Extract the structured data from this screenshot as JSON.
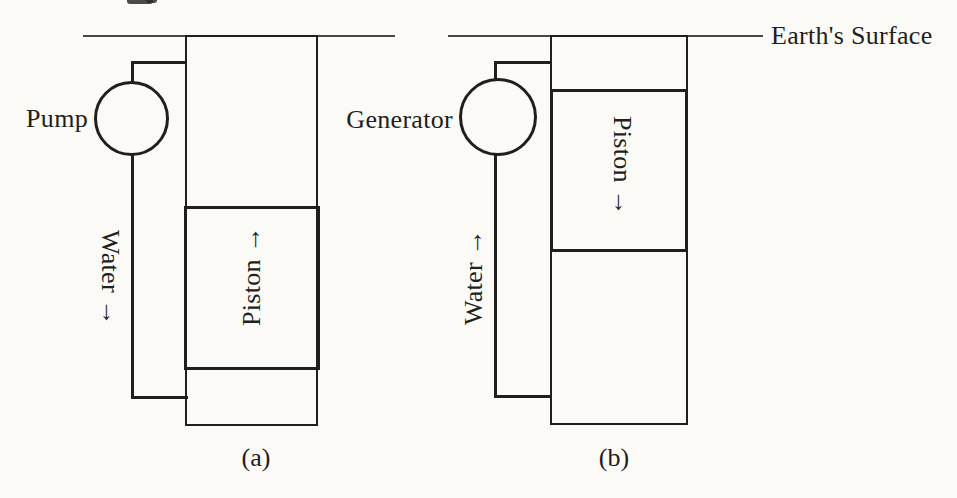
{
  "colors": {
    "ink": "#211e1b",
    "paper": "#fbfaf7",
    "surface-line": "#4a4845"
  },
  "surface_label": "Earth's Surface",
  "panels": {
    "a": {
      "machine": "Pump",
      "water": "Water →",
      "piston": "Piston →",
      "caption": "(a)"
    },
    "b": {
      "machine": "Generator",
      "water": "Water →",
      "piston": "Piston →",
      "caption": "(b)"
    }
  }
}
